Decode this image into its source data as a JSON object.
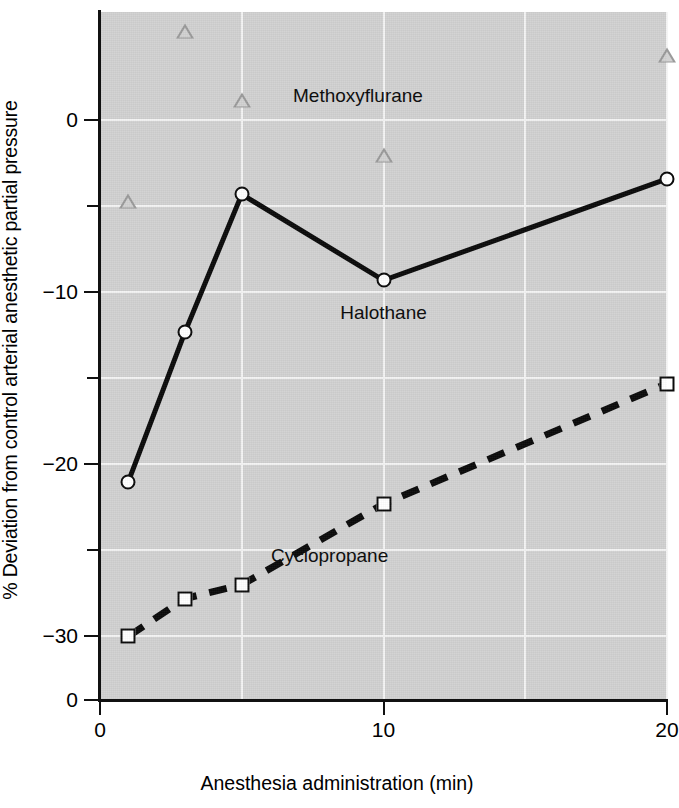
{
  "chart_data": {
    "type": "line",
    "title": "",
    "xlabel": "Anesthesia administration (min)",
    "ylabel": "% Deviation from control arterial anesthetic partial pressure",
    "xlim": [
      0,
      20
    ],
    "ylim": [
      -33.7,
      6.3
    ],
    "grid": true,
    "legend_position": "inline-annotations",
    "x_ticks": [
      {
        "value": 0,
        "label": "0"
      },
      {
        "value": 10,
        "label": "10"
      },
      {
        "value": 20,
        "label": "20"
      }
    ],
    "y_ticks": [
      {
        "value": 0,
        "label": "0",
        "major": true
      },
      {
        "value": -5,
        "label": "",
        "major": false
      },
      {
        "value": -10,
        "label": "-10",
        "major": true
      },
      {
        "value": -15,
        "label": "",
        "major": false
      },
      {
        "value": -20,
        "label": "-20",
        "major": true
      },
      {
        "value": -25,
        "label": "",
        "major": false
      },
      {
        "value": -30,
        "label": "-30",
        "major": true
      },
      {
        "value": -33.7,
        "label": "0",
        "major": true
      }
    ],
    "x_gridlines": [
      5,
      10,
      15,
      20
    ],
    "y_gridlines": [
      0,
      -5,
      -10,
      -15,
      -20,
      -25,
      -30
    ],
    "series": [
      {
        "name": "Halothane",
        "marker": "open-circle",
        "line": "solid",
        "color": "#0a0a0a",
        "label_x": 10.0,
        "label_y": -11.2,
        "points": [
          {
            "x": 1,
            "y": -21.0
          },
          {
            "x": 3,
            "y": -12.3
          },
          {
            "x": 5,
            "y": -4.3
          },
          {
            "x": 10,
            "y": -9.3
          },
          {
            "x": 20,
            "y": -3.4
          }
        ]
      },
      {
        "name": "Cyclopropane",
        "marker": "open-square",
        "line": "dashed",
        "color": "#0a0a0a",
        "label_x": 8.1,
        "label_y": -25.3,
        "points": [
          {
            "x": 1,
            "y": -30.0
          },
          {
            "x": 3,
            "y": -27.8
          },
          {
            "x": 5,
            "y": -27.0
          },
          {
            "x": 10,
            "y": -22.3
          },
          {
            "x": 20,
            "y": -15.3
          }
        ]
      },
      {
        "name": "Methoxyflurane",
        "marker": "open-triangle",
        "line": "none",
        "color": "#9a9a9a",
        "label_x": 9.1,
        "label_y": 1.4,
        "points": [
          {
            "x": 1,
            "y": -4.7
          },
          {
            "x": 3,
            "y": 5.2
          },
          {
            "x": 5,
            "y": 1.2
          },
          {
            "x": 10,
            "y": -2.0
          },
          {
            "x": 20,
            "y": 3.8
          }
        ]
      }
    ]
  },
  "axes": {
    "x_title": "Anesthesia administration (min)",
    "y_title": "% Deviation from control arterial anesthetic partial pressure"
  },
  "colors": {
    "plot_background": "#d2d2d2",
    "gridline": "#f4f4f4",
    "axis": "#111111",
    "marker_fill": "#ffffff",
    "triangle_outline": "#9a9a9a"
  }
}
